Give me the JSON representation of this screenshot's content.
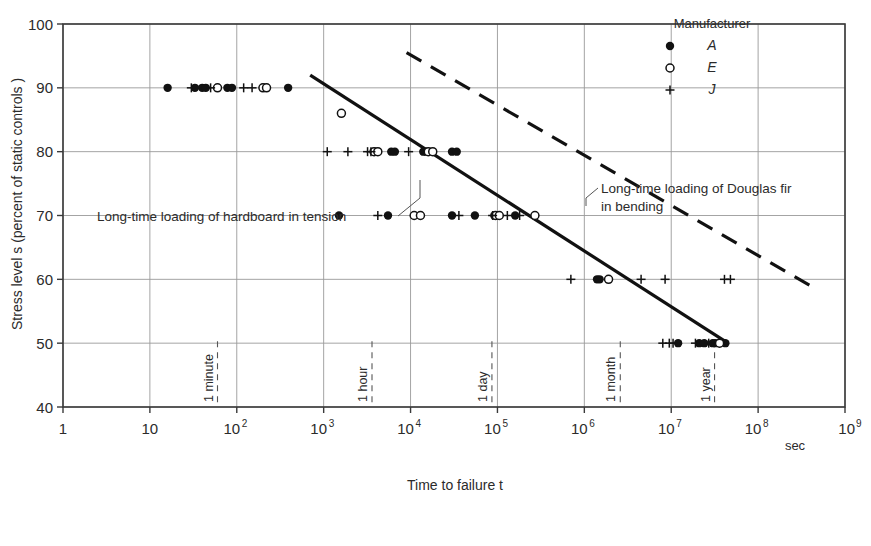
{
  "figure": {
    "background_color": "#ffffff",
    "frame_color": "#3a3a3a",
    "grid_color": "#9a9a9a",
    "data_color": "#111111"
  },
  "axes": {
    "x_title": "Time to failure t",
    "x_unit_label": "sec",
    "y_title": "Stress level s (percent of static controls )",
    "x_tick_labels": [
      "1",
      "10",
      "10",
      "10",
      "10",
      "10",
      "10",
      "10",
      "10",
      "10"
    ],
    "x_tick_exponents": [
      "",
      "",
      "2",
      "3",
      "4",
      "5",
      "6",
      "7",
      "8",
      "9"
    ],
    "y_tick_labels": [
      "40",
      "50",
      "60",
      "70",
      "80",
      "90",
      "100"
    ]
  },
  "legend": {
    "title": "Manufacturer",
    "entries": [
      {
        "label": "A",
        "marker": "filled-circle"
      },
      {
        "label": "E",
        "marker": "open-circle"
      },
      {
        "label": "J",
        "marker": "plus"
      }
    ]
  },
  "annotations": {
    "hardboard": "Long-time loading of hardboard in tension",
    "douglas_fir_line1": "Long-time loading of Douglas fir",
    "douglas_fir_line2": "in bending"
  },
  "time_markers": [
    {
      "label": "1 minute",
      "seconds": 60
    },
    {
      "label": "1 hour",
      "seconds": 3600
    },
    {
      "label": "1 day",
      "seconds": 86400
    },
    {
      "label": "1 month",
      "seconds": 2592000
    },
    {
      "label": "1 year",
      "seconds": 31536000
    }
  ],
  "chart_data": {
    "type": "scatter",
    "title": "",
    "xlabel": "Time to failure t",
    "ylabel": "Stress level s (percent of static controls )",
    "x_scale": "log",
    "xlim": [
      1,
      1000000000
    ],
    "ylim": [
      40,
      100
    ],
    "grid": true,
    "legend_position": "top-right",
    "legend_title": "Manufacturer",
    "series": [
      {
        "name": "A",
        "marker": "filled-circle",
        "points": [
          [
            16,
            90
          ],
          [
            33,
            90
          ],
          [
            40,
            90
          ],
          [
            44,
            90
          ],
          [
            78,
            90
          ],
          [
            88,
            90
          ],
          [
            390,
            90
          ],
          [
            6000,
            80
          ],
          [
            6600,
            80
          ],
          [
            14000,
            80
          ],
          [
            15000,
            80
          ],
          [
            30000,
            80
          ],
          [
            34000,
            80
          ],
          [
            1500,
            70
          ],
          [
            5500,
            70
          ],
          [
            30000,
            70
          ],
          [
            55000,
            70
          ],
          [
            92000,
            70
          ],
          [
            100000,
            70
          ],
          [
            160000,
            70
          ],
          [
            1400000,
            60
          ],
          [
            1500000,
            60
          ],
          [
            12000000,
            50
          ],
          [
            21000000,
            50
          ],
          [
            24000000,
            50
          ],
          [
            30000000,
            50
          ],
          [
            32000000,
            50
          ],
          [
            42000000,
            50
          ]
        ]
      },
      {
        "name": "E",
        "marker": "open-circle",
        "points": [
          [
            60,
            90
          ],
          [
            200,
            90
          ],
          [
            220,
            90
          ],
          [
            1600,
            86
          ],
          [
            3800,
            80
          ],
          [
            4200,
            80
          ],
          [
            16000,
            80
          ],
          [
            18000,
            80
          ],
          [
            11000,
            70
          ],
          [
            13000,
            70
          ],
          [
            95000,
            70
          ],
          [
            105000,
            70
          ],
          [
            270000,
            70
          ],
          [
            1900000,
            60
          ],
          [
            36000000,
            50
          ]
        ]
      },
      {
        "name": "J",
        "marker": "plus",
        "points": [
          [
            30,
            90
          ],
          [
            50,
            90
          ],
          [
            120,
            90
          ],
          [
            150,
            90
          ],
          [
            1100,
            80
          ],
          [
            1900,
            80
          ],
          [
            3200,
            80
          ],
          [
            3500,
            80
          ],
          [
            9500,
            80
          ],
          [
            4200,
            70
          ],
          [
            36000,
            70
          ],
          [
            88000,
            70
          ],
          [
            130000,
            70
          ],
          [
            180000,
            70
          ],
          [
            700000,
            60
          ],
          [
            4500000,
            60
          ],
          [
            8500000,
            60
          ],
          [
            41000000,
            60
          ],
          [
            48000000,
            60
          ],
          [
            8000000,
            50
          ],
          [
            9500000,
            50
          ],
          [
            10500000,
            50
          ],
          [
            19000000,
            50
          ],
          [
            27000000,
            50
          ]
        ]
      }
    ],
    "trend_lines": [
      {
        "name": "Long-time loading of hardboard in tension",
        "style": "solid",
        "x_start": 700,
        "y_start": 92,
        "x_end": 45000000,
        "y_end": 50
      },
      {
        "name": "Long-time loading of Douglas fir in bending",
        "style": "dashed",
        "x_start": 9000,
        "y_start": 95.5,
        "x_end": 400000000,
        "y_end": 59
      }
    ]
  }
}
